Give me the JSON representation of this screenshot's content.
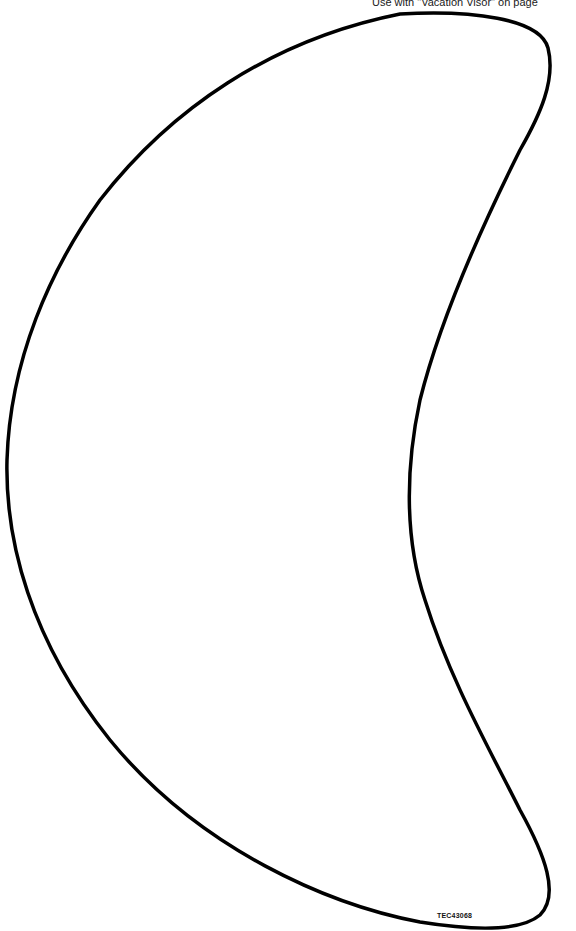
{
  "page": {
    "header_note": "Use with \"Vacation Visor\" on page",
    "product_code": "TEC43068"
  },
  "shape": {
    "type": "crescent-moon-outline",
    "stroke_color": "#000000",
    "fill_color": "#ffffff"
  }
}
